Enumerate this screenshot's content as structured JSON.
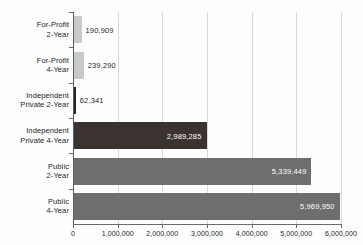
{
  "chart_data": {
    "type": "bar",
    "orientation": "horizontal",
    "title": "",
    "xlabel": "",
    "ylabel": "",
    "xlim": [
      0,
      6000000
    ],
    "grid": true,
    "legend": "none",
    "categories": [
      "For-Profit 2-Year",
      "For-Profit 4-Year",
      "Independent Private 2-Year",
      "Independent Private 4-Year",
      "Public 2-Year",
      "Public 4-Year"
    ],
    "values": [
      190909,
      239290,
      62341,
      2989285,
      5339449,
      5969950
    ],
    "value_labels": [
      "190,909",
      "239,290",
      "62,341",
      "2,989,285",
      "5,339,449",
      "5,969,950"
    ],
    "bar_colors": [
      "#c9c9c9",
      "#c9c9c9",
      "#2a2522",
      "#3a3330",
      "#6e6e6e",
      "#6e6e6e"
    ],
    "label_placement": [
      "outside",
      "outside",
      "outside",
      "inside",
      "inside",
      "inside"
    ],
    "xticks": [
      0,
      1000000,
      2000000,
      3000000,
      4000000,
      5000000,
      6000000
    ],
    "xtick_labels": [
      "0",
      "1,000,000",
      "2,000,000",
      "3,000,000",
      "4,000,000",
      "5,000,000",
      "6,000,000"
    ]
  },
  "categories_lines": [
    [
      "For-Profit",
      "2-Year"
    ],
    [
      "For-Profit",
      "4-Year"
    ],
    [
      "Independent",
      "Private 2-Year"
    ],
    [
      "Independent",
      "Private 4-Year"
    ],
    [
      "Public",
      "2-Year"
    ],
    [
      "Public",
      "4-Year"
    ]
  ],
  "colors": {
    "background": "#fefefe",
    "gridline": "#d8d8d8",
    "axis": "#5c5c5c",
    "text": "#1a1a1a",
    "value_text_light": "#ffffff",
    "value_text_dark": "#1e1e1e"
  }
}
